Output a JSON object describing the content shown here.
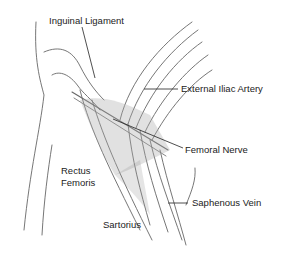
{
  "figure": {
    "labels": {
      "inguinal_ligament": "Inguinal Ligament",
      "external_iliac_artery": "External Iliac Artery",
      "femoral_nerve": "Femoral Nerve",
      "rectus_femoris_line1": "Rectus",
      "rectus_femoris_line2": "Femoris",
      "saphenous_vein": "Saphenous Vein",
      "sartorius": "Sartorius"
    },
    "colors": {
      "ink": "#555555",
      "shade": "#9a9a9a",
      "text": "#222222"
    }
  }
}
